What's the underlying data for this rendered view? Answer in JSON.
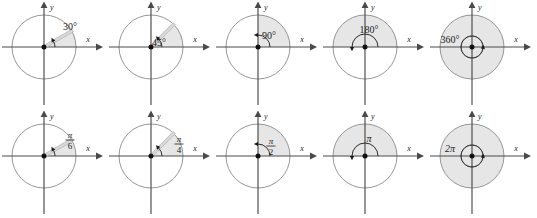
{
  "figure": {
    "rows": 2,
    "cols": 5,
    "background": "#ffffff",
    "axis_color": "#4a4a4a",
    "circle_color": "#8a8a8a",
    "shade_color": "#e6e6e6",
    "ray_color": "#b8b8b8",
    "text_color": "#1a1a1a"
  },
  "axis_labels": {
    "x": "x",
    "y": "y"
  },
  "panels": [
    {
      "id": "deg-30",
      "row": 0,
      "col": 0,
      "measure": "degrees",
      "label": "30°",
      "label_kind": "plain",
      "angle_deg": 30,
      "direction": "counterclockwise",
      "turns": 0,
      "shaded": true,
      "shade_region": "wedge-30",
      "ray_drawn": true
    },
    {
      "id": "deg-45",
      "row": 0,
      "col": 1,
      "measure": "degrees",
      "label": "45°",
      "label_kind": "plain",
      "angle_deg": 45,
      "direction": "counterclockwise",
      "turns": 0,
      "shaded": true,
      "shade_region": "wedge-45",
      "ray_drawn": true
    },
    {
      "id": "deg-90",
      "row": 0,
      "col": 2,
      "measure": "degrees",
      "label": "90°",
      "label_kind": "plain",
      "angle_deg": 90,
      "direction": "counterclockwise",
      "turns": 0,
      "shaded": true,
      "shade_region": "quadrant-I",
      "ray_drawn": false
    },
    {
      "id": "deg-180",
      "row": 0,
      "col": 3,
      "measure": "degrees",
      "label": "180°",
      "label_kind": "plain",
      "angle_deg": 180,
      "direction": "counterclockwise",
      "turns": 0,
      "shaded": true,
      "shade_region": "upper-half",
      "ray_drawn": false
    },
    {
      "id": "deg-360",
      "row": 0,
      "col": 4,
      "measure": "degrees",
      "label": "360°",
      "label_kind": "plain",
      "angle_deg": 360,
      "direction": "counterclockwise",
      "turns": 1,
      "shaded": true,
      "shade_region": "full-disk",
      "ray_drawn": false
    },
    {
      "id": "rad-pi-6",
      "row": 1,
      "col": 0,
      "measure": "radians",
      "label": "π/6",
      "label_kind": "fraction",
      "numerator": "π",
      "denominator": "6",
      "angle_deg": 30,
      "direction": "counterclockwise",
      "turns": 0,
      "shaded": true,
      "shade_region": "wedge-30",
      "ray_drawn": true
    },
    {
      "id": "rad-pi-4",
      "row": 1,
      "col": 1,
      "measure": "radians",
      "label": "π/4",
      "label_kind": "fraction",
      "numerator": "π",
      "denominator": "4",
      "angle_deg": 45,
      "direction": "counterclockwise",
      "turns": 0,
      "shaded": true,
      "shade_region": "wedge-45",
      "ray_drawn": true
    },
    {
      "id": "rad-pi-2",
      "row": 1,
      "col": 2,
      "measure": "radians",
      "label": "π/2",
      "label_kind": "fraction",
      "numerator": "π",
      "denominator": "2",
      "angle_deg": 90,
      "direction": "counterclockwise",
      "turns": 0,
      "shaded": true,
      "shade_region": "quadrant-I",
      "ray_drawn": false
    },
    {
      "id": "rad-pi",
      "row": 1,
      "col": 3,
      "measure": "radians",
      "label": "π",
      "label_kind": "plain",
      "angle_deg": 180,
      "direction": "counterclockwise",
      "turns": 0,
      "shaded": true,
      "shade_region": "upper-half",
      "ray_drawn": false
    },
    {
      "id": "rad-2pi",
      "row": 1,
      "col": 4,
      "measure": "radians",
      "label": "2π",
      "label_kind": "plain",
      "angle_deg": 360,
      "direction": "counterclockwise",
      "turns": 1,
      "shaded": true,
      "shade_region": "full-disk",
      "ray_drawn": false
    }
  ]
}
